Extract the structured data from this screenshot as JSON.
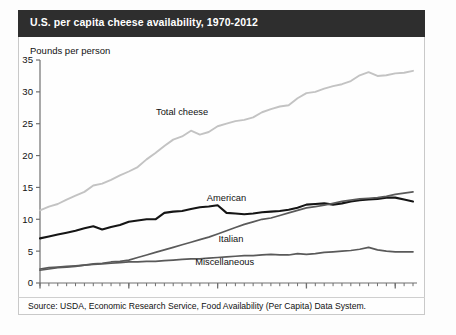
{
  "header": {
    "title": "U.S. per capita cheese availability, 1970-2012"
  },
  "axis_title": "Pounds per person",
  "source": "Source: USDA, Economic Research Service, Food Availability (Per Capita) Data System.",
  "colors": {
    "titlebar": "#2e2e2e",
    "total_cheese": "#c3c3c3",
    "american": "#151515",
    "italian": "#5a5a5a",
    "miscellaneous": "#595959",
    "axis": "#6f6f6f",
    "frame": "#c9c9c9"
  },
  "chart_data": {
    "type": "line",
    "title": "U.S. per capita cheese availability, 1970-2012",
    "xlabel": "",
    "ylabel": "Pounds per person",
    "xlim": [
      1970,
      2012
    ],
    "ylim": [
      0,
      35
    ],
    "ytick_labels": [
      "0",
      "5",
      "10",
      "15",
      "20",
      "25",
      "30",
      "35"
    ],
    "yticks": [
      0,
      5,
      10,
      15,
      20,
      25,
      30,
      35
    ],
    "xtick_labels": [
      "1970",
      "1980",
      "1990",
      "2000",
      "2010"
    ],
    "xticks": [
      1970,
      1980,
      1990,
      2000,
      2010
    ],
    "minor_xticks_every": 1,
    "grid": false,
    "legend": "inline-labels",
    "x": [
      1970,
      1971,
      1972,
      1973,
      1974,
      1975,
      1976,
      1977,
      1978,
      1979,
      1980,
      1981,
      1982,
      1983,
      1984,
      1985,
      1986,
      1987,
      1988,
      1989,
      1990,
      1991,
      1992,
      1993,
      1994,
      1995,
      1996,
      1997,
      1998,
      1999,
      2000,
      2001,
      2002,
      2003,
      2004,
      2005,
      2006,
      2007,
      2008,
      2009,
      2010,
      2011,
      2012
    ],
    "series": [
      {
        "name": "Total cheese",
        "label": "Total cheese",
        "color": "#c3c3c3",
        "label_xy": [
          1986.0,
          26.4
        ],
        "values": [
          11.4,
          12.0,
          12.4,
          13.1,
          13.7,
          14.3,
          15.3,
          15.6,
          16.2,
          16.9,
          17.5,
          18.2,
          19.4,
          20.4,
          21.5,
          22.5,
          23.0,
          23.9,
          23.3,
          23.7,
          24.6,
          25.0,
          25.4,
          25.6,
          26.0,
          26.8,
          27.3,
          27.7,
          27.9,
          29.0,
          29.8,
          30.0,
          30.5,
          30.9,
          31.2,
          31.7,
          32.6,
          33.1,
          32.5,
          32.6,
          32.9,
          33.0,
          33.3
        ]
      },
      {
        "name": "American",
        "label": "American",
        "color": "#151515",
        "label_xy": [
          1991.0,
          12.9
        ],
        "values": [
          7.0,
          7.3,
          7.6,
          7.9,
          8.2,
          8.6,
          8.9,
          8.4,
          8.8,
          9.1,
          9.6,
          9.8,
          10.0,
          10.0,
          11.0,
          11.2,
          11.3,
          11.6,
          11.9,
          12.0,
          12.2,
          11.0,
          10.9,
          10.8,
          10.9,
          11.1,
          11.2,
          11.3,
          11.5,
          11.8,
          12.3,
          12.4,
          12.5,
          12.3,
          12.5,
          12.8,
          13.0,
          13.1,
          13.2,
          13.4,
          13.4,
          13.1,
          12.8
        ]
      },
      {
        "name": "Italian",
        "label": "Italian",
        "color": "#5a5a5a",
        "label_xy": [
          1991.5,
          6.4
        ],
        "values": [
          2.0,
          2.2,
          2.4,
          2.5,
          2.6,
          2.8,
          3.0,
          3.1,
          3.3,
          3.4,
          3.6,
          4.0,
          4.4,
          4.8,
          5.2,
          5.6,
          6.0,
          6.4,
          6.8,
          7.2,
          7.7,
          8.2,
          8.7,
          9.2,
          9.6,
          10.0,
          10.2,
          10.6,
          11.0,
          11.4,
          11.8,
          12.0,
          12.2,
          12.5,
          12.8,
          13.0,
          13.2,
          13.3,
          13.4,
          13.6,
          13.9,
          14.1,
          14.3
        ]
      },
      {
        "name": "Miscellaneous",
        "label": "Miscellaneous",
        "color": "#595959",
        "label_xy": [
          1990.8,
          2.8
        ],
        "values": [
          2.2,
          2.4,
          2.5,
          2.6,
          2.7,
          2.8,
          2.9,
          3.0,
          3.1,
          3.2,
          3.3,
          3.3,
          3.4,
          3.4,
          3.5,
          3.6,
          3.7,
          3.8,
          3.8,
          3.9,
          4.0,
          4.1,
          4.2,
          4.3,
          4.3,
          4.4,
          4.5,
          4.4,
          4.4,
          4.6,
          4.5,
          4.6,
          4.8,
          4.9,
          5.0,
          5.1,
          5.3,
          5.6,
          5.2,
          5.0,
          4.9,
          4.9,
          4.9
        ]
      }
    ]
  }
}
